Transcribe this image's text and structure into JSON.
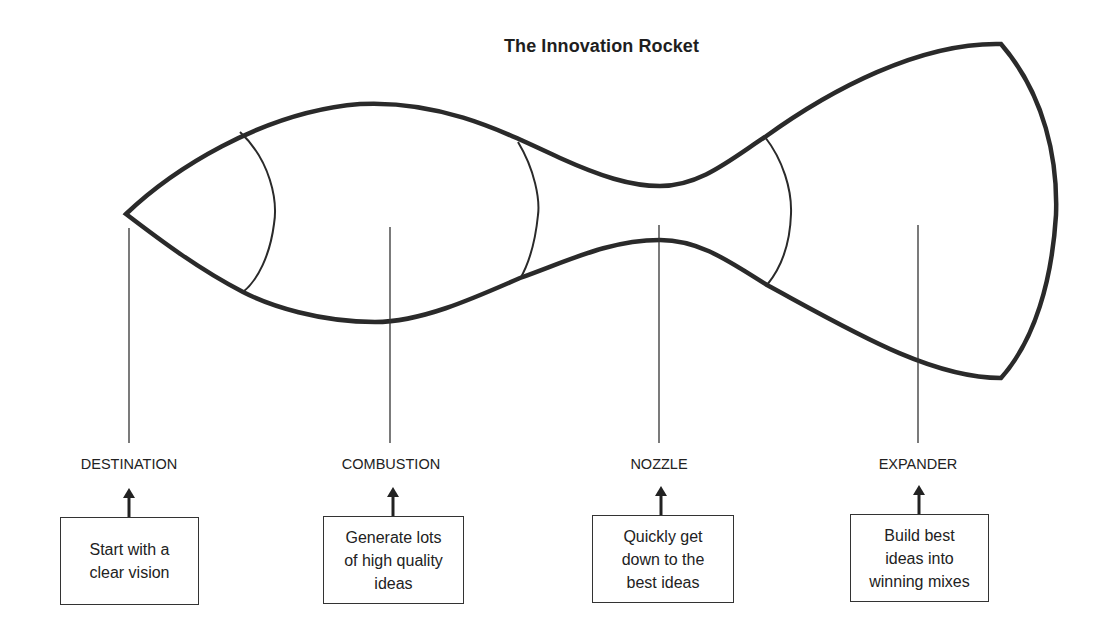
{
  "title": "The Innovation Rocket",
  "colors": {
    "stroke": "#2a2a2a",
    "background": "#ffffff",
    "text": "#222222"
  },
  "stages": [
    {
      "label": "DESTINATION",
      "description": "Start with a\nclear vision"
    },
    {
      "label": "COMBUSTION",
      "description": "Generate lots\nof high quality\nideas"
    },
    {
      "label": "NOZZLE",
      "description": "Quickly get\ndown to the\nbest ideas"
    },
    {
      "label": "EXPANDER",
      "description": "Build best\nideas into\nwinning mixes"
    }
  ]
}
